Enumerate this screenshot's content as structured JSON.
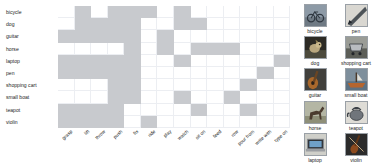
{
  "chart_data": {
    "type": "heatmap",
    "title": "",
    "xlabel": "",
    "ylabel": "",
    "grid": true,
    "legend_position": "none",
    "row_labels": [
      "bicycle",
      "dog",
      "guitar",
      "horse",
      "laptop",
      "pen",
      "shopping cart",
      "small boat",
      "teapot",
      "violin"
    ],
    "col_labels": [
      "grasp",
      "lift",
      "throw",
      "push",
      "fix",
      "ride",
      "play",
      "watch",
      "sit on",
      "feed",
      "row",
      "pour from",
      "write with",
      "type on"
    ],
    "value_on": 1,
    "value_off": 0,
    "on_color": "#c8cace",
    "off_color": "#ffffff",
    "grid_color": "#eceef2",
    "matrix": [
      [
        0,
        1,
        0,
        1,
        1,
        1,
        0,
        1,
        0,
        0,
        0,
        0,
        0,
        0
      ],
      [
        0,
        1,
        1,
        1,
        1,
        0,
        0,
        1,
        1,
        0,
        0,
        0,
        0,
        0
      ],
      [
        1,
        1,
        1,
        1,
        1,
        0,
        1,
        0,
        0,
        0,
        0,
        0,
        0,
        0
      ],
      [
        0,
        0,
        0,
        0,
        1,
        0,
        1,
        0,
        1,
        1,
        1,
        0,
        0,
        0
      ],
      [
        1,
        1,
        1,
        1,
        1,
        0,
        0,
        1,
        0,
        0,
        0,
        0,
        0,
        1
      ],
      [
        1,
        1,
        1,
        1,
        1,
        0,
        0,
        0,
        0,
        0,
        0,
        0,
        1,
        0
      ],
      [
        0,
        0,
        0,
        1,
        1,
        0,
        0,
        0,
        0,
        0,
        0,
        1,
        0,
        0
      ],
      [
        0,
        0,
        0,
        1,
        1,
        0,
        0,
        1,
        0,
        0,
        1,
        0,
        0,
        0
      ],
      [
        1,
        1,
        1,
        1,
        0,
        0,
        0,
        0,
        1,
        0,
        0,
        1,
        0,
        0
      ],
      [
        1,
        1,
        1,
        1,
        0,
        1,
        0,
        0,
        0,
        0,
        0,
        0,
        0,
        0
      ]
    ]
  },
  "gallery": {
    "left_column": [
      {
        "label": "bicycle",
        "icon": "bicycle-thumbnail"
      },
      {
        "label": "dog",
        "icon": "dog-thumbnail"
      },
      {
        "label": "guitar",
        "icon": "guitar-thumbnail"
      },
      {
        "label": "horse",
        "icon": "horse-thumbnail"
      },
      {
        "label": "laptop",
        "icon": "laptop-thumbnail"
      }
    ],
    "right_column": [
      {
        "label": "pen",
        "icon": "pen-thumbnail"
      },
      {
        "label": "shopping cart",
        "icon": "shopping-cart-thumbnail"
      },
      {
        "label": "small boat",
        "icon": "small-boat-thumbnail"
      },
      {
        "label": "teapot",
        "icon": "teapot-thumbnail"
      },
      {
        "label": "violin",
        "icon": "violin-thumbnail"
      }
    ]
  }
}
